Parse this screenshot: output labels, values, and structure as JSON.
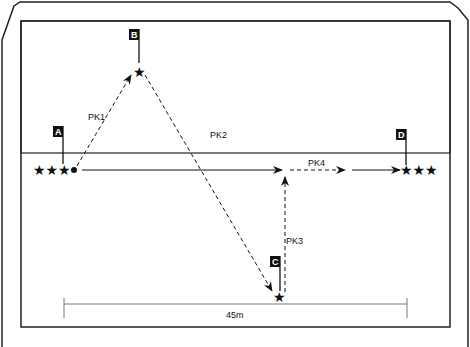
{
  "diagram": {
    "type": "drill-field-diagram",
    "points": {
      "A": {
        "label": "A",
        "stars": "★★★"
      },
      "B": {
        "label": "B",
        "stars": "★"
      },
      "C": {
        "label": "C",
        "stars": "★"
      },
      "D": {
        "label": "D",
        "stars": "★★★"
      }
    },
    "paths": [
      {
        "id": "PK1",
        "label": "PK1",
        "from": "A",
        "to": "B",
        "style": "dashed"
      },
      {
        "id": "PK2",
        "label": "PK2",
        "from": "B",
        "to": "C",
        "style": "dashed"
      },
      {
        "id": "PK3",
        "label": "PK3",
        "from": "C",
        "to": "main-line",
        "style": "dashed"
      },
      {
        "id": "PK4",
        "label": "PK4",
        "from": "main-line",
        "to": "D",
        "style": "dashed"
      }
    ],
    "scale": {
      "label": "45m"
    },
    "colors": {
      "line": "#111111",
      "background": "#ffffff"
    }
  }
}
